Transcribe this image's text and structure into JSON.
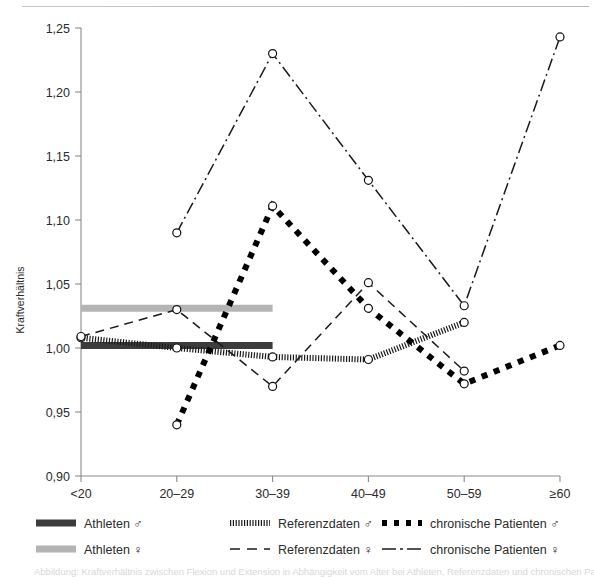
{
  "figure": {
    "y_axis_title": "Kraftverhältnis",
    "top_rule_color": "#bfbfbf",
    "axis_color": "#7a7a7a",
    "caption_text": "Abbildung: Kraftverhältnis zwischen Flexion und Extension in Abhängigkeit vom Alter bei Athleten, Referenzdaten und chronischen Patienten (Meßpositionen"
  },
  "chart_data": {
    "type": "line",
    "title": "",
    "xlabel": "",
    "ylabel": "Kraftverhältnis",
    "categories": [
      "<20",
      "20–29",
      "30–39",
      "40–49",
      "50–59",
      "≥60"
    ],
    "ylim": [
      0.9,
      1.25
    ],
    "yticks": [
      0.9,
      0.95,
      1.0,
      1.05,
      1.1,
      1.15,
      1.2,
      1.25
    ],
    "ytick_labels": [
      "0,90",
      "0,95",
      "1,00",
      "1,05",
      "1,10",
      "1,15",
      "1,20",
      "1,25"
    ],
    "grid": false,
    "legend_position": "below",
    "series": [
      {
        "name": "Athleten ♂",
        "key": "athleten_m",
        "style": "thick-solid-bar",
        "color": "#3c3c3c",
        "markers": false,
        "x": [
          "<20",
          "20–29",
          "30–39"
        ],
        "values": [
          1.002,
          1.002,
          1.002
        ]
      },
      {
        "name": "Athleten ♀",
        "key": "athleten_w",
        "style": "thick-solid-bar",
        "color": "#b4b4b4",
        "markers": false,
        "x": [
          "<20",
          "20–29",
          "30–39"
        ],
        "values": [
          1.031,
          1.031,
          1.031
        ]
      },
      {
        "name": "Referenzdaten ♂",
        "key": "referenz_m",
        "style": "fine-hatched",
        "color": "#1a1a1a",
        "markers": true,
        "x": [
          "<20",
          "20–29",
          "30–39",
          "40–49",
          "50–59"
        ],
        "values": [
          1.008,
          1.0,
          0.993,
          0.991,
          1.02
        ]
      },
      {
        "name": "Referenzdaten ♀",
        "key": "referenz_w",
        "style": "dashed",
        "color": "#1a1a1a",
        "markers": true,
        "x": [
          "<20",
          "20–29",
          "30–39",
          "40–49",
          "50–59"
        ],
        "values": [
          1.009,
          1.03,
          0.97,
          1.051,
          0.982
        ]
      },
      {
        "name": "chronische Patienten ♂",
        "key": "chronisch_m",
        "style": "thick-dotted",
        "color": "#000000",
        "markers": true,
        "x": [
          "20–29",
          "30–39",
          "40–49",
          "50–59",
          "≥60"
        ],
        "values": [
          0.94,
          1.111,
          1.031,
          0.972,
          1.002
        ]
      },
      {
        "name": "chronische Patienten ♀",
        "key": "chronisch_w",
        "style": "dash-dot",
        "color": "#1a1a1a",
        "markers": true,
        "x": [
          "20–29",
          "30–39",
          "40–49",
          "50–59",
          "≥60"
        ],
        "values": [
          1.09,
          1.23,
          1.131,
          1.033,
          1.243
        ]
      }
    ]
  },
  "legend": {
    "entries": [
      {
        "label": "Athleten ♂",
        "key": "athleten_m"
      },
      {
        "label": "Referenzdaten ♂",
        "key": "referenz_m"
      },
      {
        "label": "chronische Patienten ♂",
        "key": "chronisch_m"
      },
      {
        "label": "Athleten ♀",
        "key": "athleten_w"
      },
      {
        "label": "Referenzdaten ♀",
        "key": "referenz_w"
      },
      {
        "label": "chronische Patienten ♀",
        "key": "chronisch_w"
      }
    ]
  }
}
